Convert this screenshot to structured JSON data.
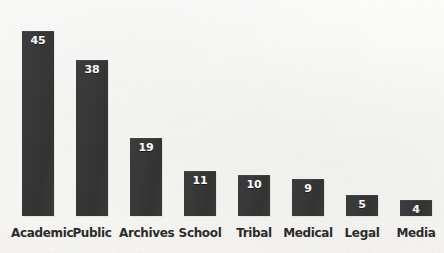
{
  "chart_data": {
    "type": "bar",
    "title": "",
    "subtitle": "",
    "xlabel": "",
    "ylabel": "",
    "categories": [
      "Academic",
      "Public",
      "Archives",
      "School",
      "Tribal",
      "Medical",
      "Legal",
      "Media"
    ],
    "values": [
      45,
      38,
      19,
      11,
      10,
      9,
      5,
      4
    ],
    "value_labels": [
      "45",
      "38",
      "19",
      "11",
      "10",
      "9",
      "5",
      "4"
    ],
    "ylim": [
      0,
      45
    ],
    "grid": false,
    "legend": false,
    "legend_position": "none",
    "orientation": "vertical",
    "data_labels_shown": true,
    "data_label_position": "inside-top",
    "axis_line": false,
    "tick_labels_y": [],
    "colors": {
      "bar": "#383838",
      "bar_highlight": "#3c3c3c",
      "background": "#f7f7f5",
      "value_label": "#fdfdfd",
      "category_label": "#2b2b2b"
    }
  },
  "layout": {
    "baseline_y": 216,
    "bar_width": 32,
    "bar_pitch": 54,
    "first_bar_x": 22,
    "px_per_unit": 4.11
  }
}
